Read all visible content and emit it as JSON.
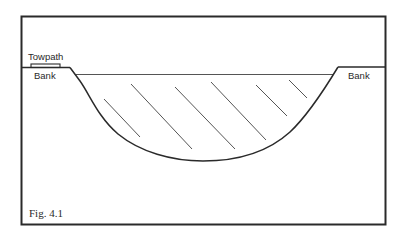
{
  "figure": {
    "caption": "Fig. 4.1",
    "labels": {
      "towpath": "Towpath",
      "bank_left": "Bank",
      "bank_right": "Bank"
    },
    "colors": {
      "line": "#2a2a2a",
      "hatch": "#555555",
      "background": "#ffffff"
    }
  }
}
